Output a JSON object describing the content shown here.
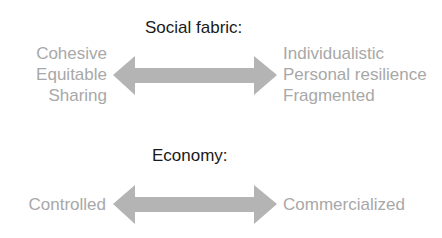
{
  "sections": [
    {
      "title": "Social fabric:",
      "left": [
        "Cohesive",
        "Equitable",
        "Sharing"
      ],
      "right": [
        "Individualistic",
        "Personal resilience",
        "Fragmented"
      ]
    },
    {
      "title": "Economy:",
      "left": [
        "Controlled"
      ],
      "right": [
        "Commercialized"
      ]
    }
  ],
  "colors": {
    "arrow": "#b4b4b4",
    "label": "#a8a8a8",
    "title": "#1a1a1a"
  }
}
